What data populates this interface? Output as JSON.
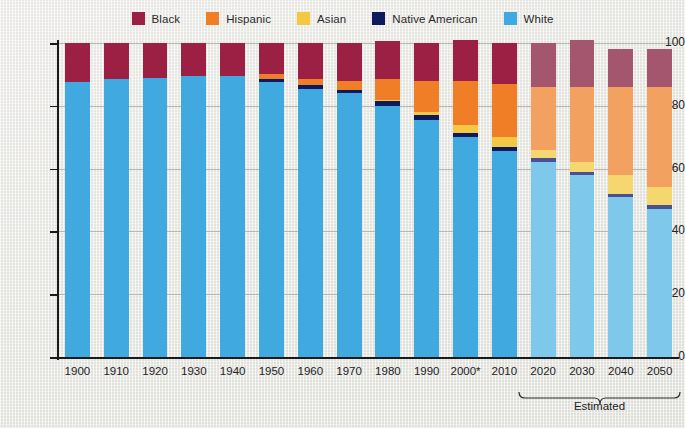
{
  "legend": {
    "items": [
      {
        "label": "Black",
        "color": "#9c1f44"
      },
      {
        "label": "Hispanic",
        "color": "#f07e26"
      },
      {
        "label": "Asian",
        "color": "#f4c842"
      },
      {
        "label": "Native American",
        "color": "#0d1a5e"
      },
      {
        "label": "White",
        "color": "#3fa9e0"
      }
    ]
  },
  "axes": {
    "y_title": "PERCENTAGE",
    "y_ticks": [
      "0",
      "20",
      "40",
      "60",
      "80",
      "100"
    ]
  },
  "annotation": {
    "estimated_label": "Estimated"
  },
  "chart_data": {
    "type": "bar",
    "stacked": true,
    "title": "",
    "xlabel": "",
    "ylabel": "PERCENTAGE",
    "ylim": [
      0,
      100
    ],
    "grid": true,
    "legend_position": "top-center",
    "categories": [
      "1900",
      "1910",
      "1920",
      "1930",
      "1940",
      "1950",
      "1960",
      "1970",
      "1980",
      "1990",
      "2000*",
      "2010",
      "2020",
      "2030",
      "2040",
      "2050"
    ],
    "estimated_categories": [
      "2020",
      "2030",
      "2040",
      "2050"
    ],
    "series": [
      {
        "name": "White",
        "color": "#3fa9e0",
        "estimated_color": "#7ec8ec",
        "values": [
          87.5,
          88.5,
          89,
          89.5,
          89.5,
          87.5,
          85.5,
          84,
          80,
          75.5,
          70,
          65.5,
          62,
          58,
          51,
          47
        ]
      },
      {
        "name": "Native American",
        "color": "#0d1a5e",
        "estimated_color": "#4a4f96",
        "values": [
          0,
          0,
          0,
          0,
          0,
          1,
          1,
          1,
          1.5,
          1.5,
          1.5,
          1.5,
          1.5,
          1,
          1,
          1.5
        ]
      },
      {
        "name": "Asian",
        "color": "#f4c842",
        "estimated_color": "#f6d66e",
        "values": [
          0,
          0,
          0,
          0,
          0,
          0,
          0,
          0,
          0.5,
          1,
          2.5,
          3,
          2.5,
          3,
          6,
          5.5
        ]
      },
      {
        "name": "Hispanic",
        "color": "#f07e26",
        "estimated_color": "#f2a160",
        "values": [
          0,
          0,
          0,
          0,
          0,
          1.5,
          2,
          3,
          6.5,
          10,
          14,
          17,
          20,
          24,
          28,
          32
        ]
      },
      {
        "name": "Black",
        "color": "#9c1f44",
        "estimated_color": "#a4566f",
        "values": [
          12.5,
          11.5,
          11,
          10.5,
          10.5,
          10,
          11.5,
          12,
          12,
          12,
          13,
          13,
          14,
          15,
          12,
          12
        ]
      }
    ],
    "series_order_bottom_to_top": [
      "White",
      "Native American",
      "Asian",
      "Hispanic",
      "Black"
    ],
    "column_totals": [
      100,
      100,
      100,
      100,
      100,
      100,
      100,
      100,
      100,
      100,
      101,
      100,
      100,
      101,
      98,
      98
    ]
  }
}
